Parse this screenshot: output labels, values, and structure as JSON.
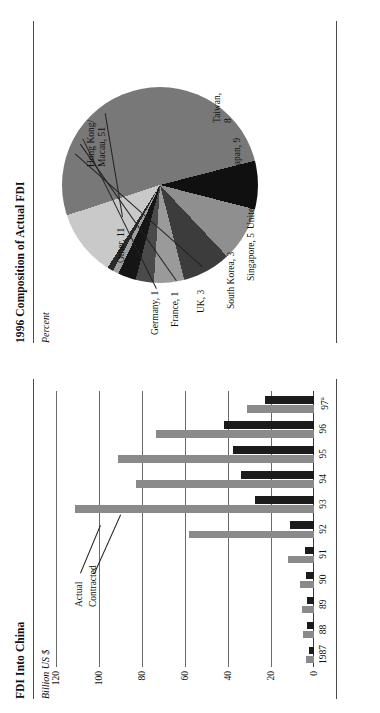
{
  "bar_panel": {
    "title": "FDI Into China",
    "subtitle": "Billion US $",
    "legend": {
      "actual": "Actual",
      "contracted": "Contracted"
    }
  },
  "pie_panel": {
    "title": "1996 Composition of Actual FDI",
    "subtitle": "Percent"
  },
  "colors": {
    "actual": "#1b1b1b",
    "contracted": "#8a8a8a",
    "rule": "#4a4a4a",
    "grid": "#6a6a6a",
    "page": "#ffffff"
  },
  "chart_data": [
    {
      "type": "bar",
      "title": "FDI Into China",
      "xlabel": "",
      "ylabel": "Billion US $",
      "ylim": [
        0,
        120
      ],
      "yticks": [
        0,
        20,
        40,
        60,
        80,
        100,
        120
      ],
      "grid": true,
      "legend_position": "inside-upper-left",
      "categories": [
        "1987",
        "88",
        "89",
        "90",
        "91",
        "92",
        "93",
        "94",
        "95",
        "96",
        "97a"
      ],
      "category_labels": [
        "1987",
        "88",
        "89",
        "90",
        "91",
        "92",
        "93",
        "94",
        "95",
        "96",
        "97ᵃ"
      ],
      "series": [
        {
          "name": "Contracted",
          "values": [
            3.7,
            5.3,
            5.6,
            6.6,
            12.0,
            58.1,
            111.4,
            82.7,
            91.3,
            73.3,
            31.0
          ]
        },
        {
          "name": "Actual",
          "values": [
            2.3,
            3.2,
            3.4,
            3.5,
            4.4,
            11.0,
            27.5,
            33.8,
            37.5,
            41.7,
            22.6
          ]
        }
      ],
      "footnote_marker": "a"
    },
    {
      "type": "pie",
      "title": "1996 Composition of Actual FDI",
      "ylabel": "Percent",
      "labels": [
        "Hong Kong/\nMacau, 51",
        "Taiwan, 8",
        "Japan, 9",
        "United States, 8",
        "Singapore, 5",
        "South Korea, 3",
        "UK, 3",
        "France, 1",
        "Germany, 1",
        "Other, 11"
      ],
      "names": [
        "Hong Kong/Macau",
        "Taiwan",
        "Japan",
        "United States",
        "Singapore",
        "South Korea",
        "UK",
        "France",
        "Germany",
        "Other"
      ],
      "values": [
        51,
        8,
        9,
        8,
        5,
        3,
        3,
        1,
        1,
        11
      ],
      "slice_colors": [
        "#787878",
        "#101010",
        "#8f8f8f",
        "#3c3c3c",
        "#9a9a9a",
        "#4a4a4a",
        "#151515",
        "#9e9e9e",
        "#2a2a2a",
        "#c9c9c9"
      ]
    }
  ]
}
